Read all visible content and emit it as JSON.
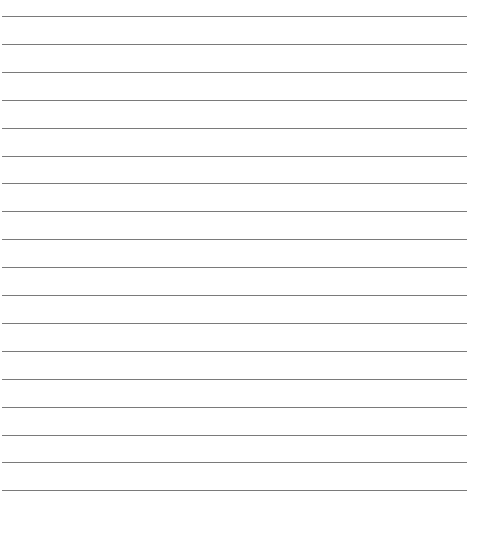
{
  "page": {
    "type": "lined-paper",
    "background": "#ffffff",
    "rule_color": "#7a7a7a",
    "rule_count": 18,
    "first_rule_y": 16,
    "rule_spacing": 27.9,
    "rule_left": 2,
    "rule_width": 465
  }
}
